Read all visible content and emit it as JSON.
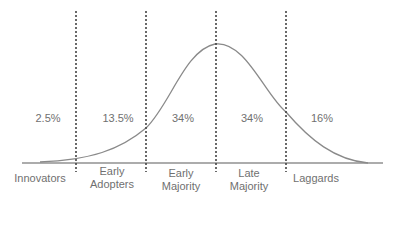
{
  "diagram": {
    "colors": {
      "curve": "#8a8a8a",
      "axis": "#5a5a5a",
      "divider": "#444444",
      "text": "#707070"
    },
    "segments": [
      {
        "percent": "2.5%",
        "label_line1": "Innovators",
        "label_line2": ""
      },
      {
        "percent": "13.5%",
        "label_line1": "Early",
        "label_line2": "Adopters"
      },
      {
        "percent": "34%",
        "label_line1": "Early",
        "label_line2": "Majority"
      },
      {
        "percent": "34%",
        "label_line1": "Late",
        "label_line2": "Majority"
      },
      {
        "percent": "16%",
        "label_line1": "Laggards",
        "label_line2": ""
      }
    ]
  }
}
